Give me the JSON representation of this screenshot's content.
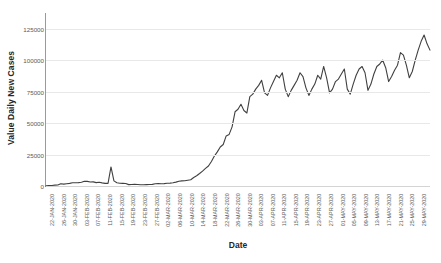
{
  "chart_data": {
    "type": "line",
    "title": "",
    "xlabel": "Date",
    "ylabel": "Value Daily New Cases",
    "ylim": [
      0,
      137500
    ],
    "yticks": [
      0,
      25000,
      50000,
      75000,
      100000,
      125000
    ],
    "ytick_labels": [
      "0",
      "25000",
      "50000",
      "75000",
      "100000",
      "125000"
    ],
    "grid": true,
    "legend": "none",
    "line_color": "#404040",
    "line_width": 1.1,
    "marker": "none",
    "xtick_labels": [
      "22-JAN-2020",
      "26-JAN-2020",
      "30-JAN-2020",
      "03-FEB-2020",
      "07-FEB-2020",
      "11-FEB-2020",
      "15-FEB-2020",
      "19-FEB-2020",
      "23-FEB-2020",
      "27-FEB-2020",
      "02-MAR-2020",
      "06-MAR-2020",
      "10-MAR-2020",
      "14-MAR-2020",
      "18-MAR-2020",
      "22-MAR-2020",
      "26-MAR-2020",
      "30-MAR-2020",
      "03-APR-2020",
      "07-APR-2020",
      "11-APR-2020",
      "15-APR-2020",
      "19-APR-2020",
      "23-APR-2020",
      "27-APR-2020",
      "01-MAY-2020",
      "05-MAY-2020",
      "09-MAY-2020",
      "13-MAY-2020",
      "17-MAY-2020",
      "21-MAY-2020",
      "25-MAY-2020",
      "29-MAY-2020"
    ],
    "x": [
      "22-JAN-2020",
      "23-JAN-2020",
      "24-JAN-2020",
      "25-JAN-2020",
      "26-JAN-2020",
      "27-JAN-2020",
      "28-JAN-2020",
      "29-JAN-2020",
      "30-JAN-2020",
      "31-JAN-2020",
      "01-FEB-2020",
      "02-FEB-2020",
      "03-FEB-2020",
      "04-FEB-2020",
      "05-FEB-2020",
      "06-FEB-2020",
      "07-FEB-2020",
      "08-FEB-2020",
      "09-FEB-2020",
      "10-FEB-2020",
      "11-FEB-2020",
      "12-FEB-2020",
      "13-FEB-2020",
      "14-FEB-2020",
      "15-FEB-2020",
      "16-FEB-2020",
      "17-FEB-2020",
      "18-FEB-2020",
      "19-FEB-2020",
      "20-FEB-2020",
      "21-FEB-2020",
      "22-FEB-2020",
      "23-FEB-2020",
      "24-FEB-2020",
      "25-FEB-2020",
      "26-FEB-2020",
      "27-FEB-2020",
      "28-FEB-2020",
      "29-FEB-2020",
      "01-MAR-2020",
      "02-MAR-2020",
      "03-MAR-2020",
      "04-MAR-2020",
      "05-MAR-2020",
      "06-MAR-2020",
      "07-MAR-2020",
      "08-MAR-2020",
      "09-MAR-2020",
      "10-MAR-2020",
      "11-MAR-2020",
      "12-MAR-2020",
      "13-MAR-2020",
      "14-MAR-2020",
      "15-MAR-2020",
      "16-MAR-2020",
      "17-MAR-2020",
      "18-MAR-2020",
      "19-MAR-2020",
      "20-MAR-2020",
      "21-MAR-2020",
      "22-MAR-2020",
      "23-MAR-2020",
      "24-MAR-2020",
      "25-MAR-2020",
      "26-MAR-2020",
      "27-MAR-2020",
      "28-MAR-2020",
      "29-MAR-2020",
      "30-MAR-2020",
      "31-MAR-2020",
      "01-APR-2020",
      "02-APR-2020",
      "03-APR-2020",
      "04-APR-2020",
      "05-APR-2020",
      "06-APR-2020",
      "07-APR-2020",
      "08-APR-2020",
      "09-APR-2020",
      "10-APR-2020",
      "11-APR-2020",
      "12-APR-2020",
      "13-APR-2020",
      "14-APR-2020",
      "15-APR-2020",
      "16-APR-2020",
      "17-APR-2020",
      "18-APR-2020",
      "19-APR-2020",
      "20-APR-2020",
      "21-APR-2020",
      "22-APR-2020",
      "23-APR-2020",
      "24-APR-2020",
      "25-APR-2020",
      "26-APR-2020",
      "27-APR-2020",
      "28-APR-2020",
      "29-APR-2020",
      "30-APR-2020",
      "01-MAY-2020",
      "02-MAY-2020",
      "03-MAY-2020",
      "04-MAY-2020",
      "05-MAY-2020",
      "06-MAY-2020",
      "07-MAY-2020",
      "08-MAY-2020",
      "09-MAY-2020",
      "10-MAY-2020",
      "11-MAY-2020",
      "12-MAY-2020",
      "13-MAY-2020",
      "14-MAY-2020",
      "15-MAY-2020",
      "16-MAY-2020",
      "17-MAY-2020",
      "18-MAY-2020",
      "19-MAY-2020",
      "20-MAY-2020",
      "21-MAY-2020",
      "22-MAY-2020",
      "23-MAY-2020",
      "24-MAY-2020",
      "25-MAY-2020",
      "26-MAY-2020",
      "27-MAY-2020",
      "28-MAY-2020",
      "29-MAY-2020",
      "30-MAY-2020",
      "31-MAY-2020"
    ],
    "values": [
      100,
      280,
      450,
      700,
      820,
      1800,
      1500,
      1800,
      2100,
      2600,
      2600,
      2700,
      3000,
      3800,
      3700,
      3200,
      3300,
      2700,
      3000,
      2500,
      2100,
      2100,
      15150,
      4100,
      2600,
      2200,
      2100,
      1950,
      1100,
      1200,
      1300,
      1200,
      1000,
      950,
      1100,
      1250,
      1300,
      1800,
      1900,
      1750,
      1900,
      2200,
      2300,
      2600,
      3100,
      3800,
      4100,
      4200,
      4600,
      5000,
      6800,
      8100,
      9900,
      11800,
      14000,
      15900,
      19500,
      23800,
      27100,
      31000,
      33000,
      39800,
      41000,
      47000,
      59000,
      61000,
      65000,
      60000,
      58000,
      71000,
      73000,
      77000,
      80000,
      84000,
      74000,
      72000,
      78000,
      83000,
      88000,
      86000,
      90000,
      77000,
      71000,
      76000,
      80000,
      84000,
      90000,
      87000,
      78000,
      72000,
      77000,
      81000,
      88000,
      85000,
      95000,
      86000,
      74000,
      77000,
      83000,
      85000,
      89000,
      93000,
      77000,
      73000,
      81000,
      88000,
      93000,
      95000,
      90000,
      76000,
      81000,
      89000,
      95000,
      97000,
      100000,
      94000,
      83000,
      87000,
      92000,
      96000,
      106000,
      104000,
      96000,
      86000,
      91000,
      100000,
      108000,
      115000,
      120000,
      113000,
      108000
    ]
  }
}
